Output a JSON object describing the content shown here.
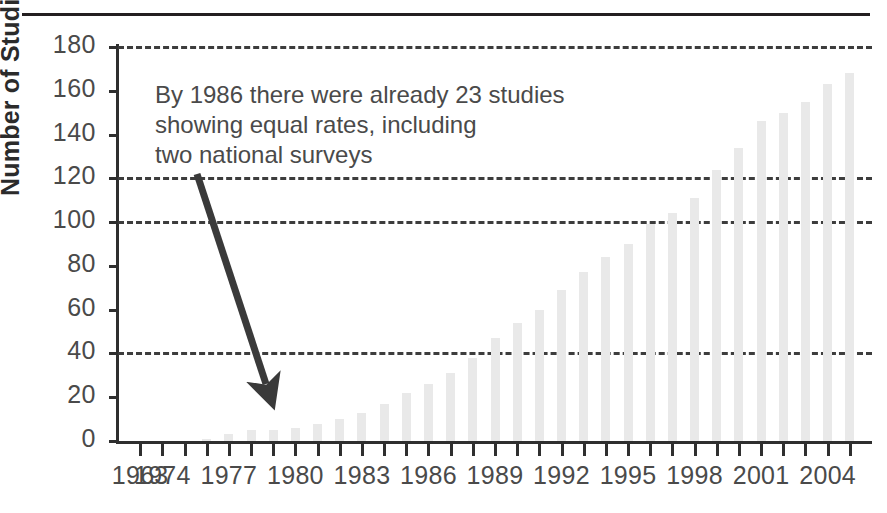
{
  "figure": {
    "top_rule": true,
    "background_color": "#ffffff"
  },
  "chart_data": {
    "type": "bar",
    "title": "",
    "xlabel": "",
    "ylabel": "Number of Studies",
    "ylim": [
      0,
      180
    ],
    "ytick_values": [
      0,
      20,
      40,
      60,
      80,
      100,
      120,
      140,
      160,
      180
    ],
    "ytick_labels": [
      "0",
      "20",
      "40",
      "60",
      "80",
      "100",
      "120",
      "140",
      "160",
      "180"
    ],
    "gridlines_at": [
      40,
      100,
      120,
      180
    ],
    "grid": "dashed-horizontal",
    "legend": "none",
    "bar_color": "#e9e9e9",
    "categories": [
      "1963",
      "1974",
      "1975",
      "1976",
      "1977",
      "1978",
      "1979",
      "1980",
      "1981",
      "1982",
      "1983",
      "1984",
      "1985",
      "1986",
      "1987",
      "1988",
      "1989",
      "1990",
      "1991",
      "1992",
      "1993",
      "1994",
      "1995",
      "1996",
      "1997",
      "1998",
      "1999",
      "2000",
      "2001",
      "2002",
      "2003",
      "2004",
      "2005"
    ],
    "values": [
      0,
      0,
      0,
      1,
      3,
      5,
      5,
      6,
      8,
      10,
      13,
      17,
      22,
      26,
      31,
      38,
      47,
      54,
      60,
      69,
      77,
      84,
      90,
      99,
      104,
      111,
      124,
      134,
      146,
      150,
      155,
      163,
      168
    ],
    "xtick_labels": [
      "1963",
      "1974",
      "1977",
      "1980",
      "1983",
      "1986",
      "1989",
      "1992",
      "1995",
      "1998",
      "2001",
      "2004"
    ],
    "xtick_label_indices": [
      0,
      1,
      4,
      7,
      10,
      13,
      16,
      19,
      22,
      25,
      28,
      31
    ],
    "annotation": {
      "lines": [
        "By 1986 there were already 23 studies",
        "showing equal rates, including",
        "two national surveys"
      ],
      "arrow": {
        "from": [
          197,
          174
        ],
        "to": [
          266,
          384
        ],
        "color": "#3a3a3a",
        "points_to_category": "1986"
      }
    }
  }
}
